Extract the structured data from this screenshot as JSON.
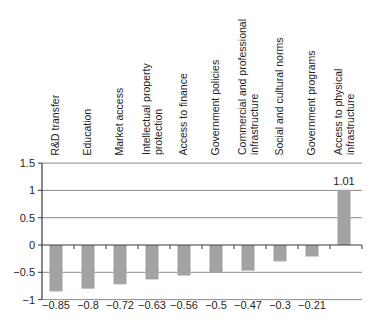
{
  "chart_data": {
    "type": "bar",
    "title": "",
    "xlabel": "",
    "ylabel": "",
    "categories": [
      "R&D transfer",
      "Education",
      "Market access",
      "Intellectual property protection",
      "Access to finance",
      "Government policies",
      "Commercial and professional infrastructure",
      "Social and cultural norms",
      "Government programs",
      "Access to physical infrastructure"
    ],
    "category_label_lines": [
      [
        "R&D transfer"
      ],
      [
        "Education"
      ],
      [
        "Market access"
      ],
      [
        "Intellectual property",
        "protection"
      ],
      [
        "Access to finance"
      ],
      [
        "Government policies"
      ],
      [
        "Commercial and professional",
        "infrastructure"
      ],
      [
        "Social and cultural norms"
      ],
      [
        "Government programs"
      ],
      [
        "Access to physical",
        "infrastructure"
      ]
    ],
    "values": [
      -0.85,
      -0.8,
      -0.72,
      -0.63,
      -0.56,
      -0.5,
      -0.47,
      -0.3,
      -0.21,
      1.01
    ],
    "value_labels": [
      "−0.85",
      "−0.8",
      "−0.72",
      "−0.63",
      "−0.56",
      "−0.5",
      "−0.47",
      "−0.3",
      "−0.21",
      "1.01"
    ],
    "ylim": [
      -1,
      1.5
    ],
    "yticks": [
      1.5,
      1,
      0.5,
      0,
      -0.5,
      -1
    ],
    "ytick_labels": [
      "1.5",
      "1",
      "0.5",
      "0",
      "−0.5",
      "−1"
    ],
    "grid": true,
    "legend": null,
    "colors": {
      "bar": "#a3a3a3",
      "grid": "#8a8a8a",
      "axis": "#3a3a3a",
      "text": "#1e1e1e"
    }
  }
}
